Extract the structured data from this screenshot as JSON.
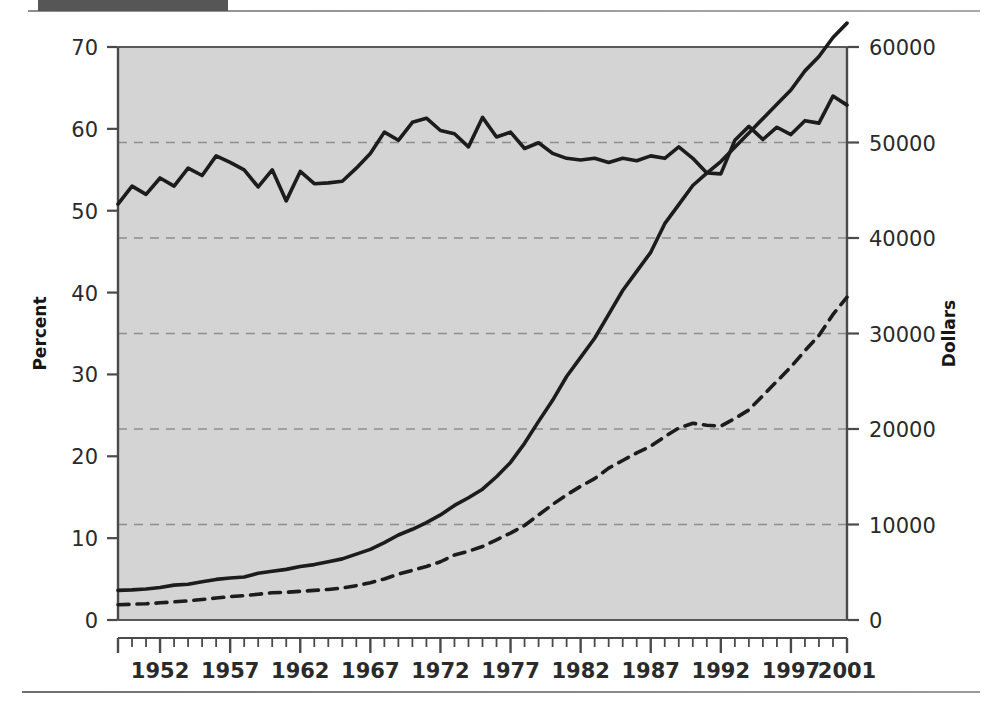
{
  "figure": {
    "title_block": "",
    "has_top_rule": true,
    "has_bottom_rule": true
  },
  "colors": {
    "plot_background": "#d4d4d4",
    "axis": "#4a4a4a",
    "series_solid": "#1c1c1c",
    "series_dashed": "#1c1c1c",
    "gridline": "#8d8d8d",
    "title_block": "#565656",
    "text": "#2a2a2a"
  },
  "chart_data": {
    "type": "line",
    "title": "",
    "xlabel": "",
    "ylabel": "Percent",
    "y2label": "Dollars",
    "xlim": [
      1949,
      2001
    ],
    "ylim": [
      0,
      70
    ],
    "y2lim": [
      0,
      60000
    ],
    "yticks": [
      0,
      10,
      20,
      30,
      40,
      50,
      60,
      70
    ],
    "yticklabels": [
      "0",
      "10",
      "20",
      "30",
      "40",
      "50",
      "60",
      "70"
    ],
    "y2ticks": [
      0,
      10000,
      20000,
      30000,
      40000,
      50000,
      60000
    ],
    "y2ticklabels": [
      "0",
      "10000",
      "20000",
      "30000",
      "40000",
      "50000",
      "60000"
    ],
    "xticks": [
      1952,
      1957,
      1962,
      1967,
      1972,
      1977,
      1982,
      1987,
      1992,
      1997,
      2001
    ],
    "xticklabels": [
      "1952",
      "1957",
      "1962",
      "1967",
      "1972",
      "1977",
      "1982",
      "1987",
      "1992",
      "1997",
      "2001"
    ],
    "minor_xticks_every": 1,
    "grid": true,
    "grid_axis": "y2",
    "grid_style": "dashed",
    "legend": null,
    "x": [
      1949,
      1950,
      1951,
      1952,
      1953,
      1954,
      1955,
      1956,
      1957,
      1958,
      1959,
      1960,
      1961,
      1962,
      1963,
      1964,
      1965,
      1966,
      1967,
      1968,
      1969,
      1970,
      1971,
      1972,
      1973,
      1974,
      1975,
      1976,
      1977,
      1978,
      1979,
      1980,
      1981,
      1982,
      1983,
      1984,
      1985,
      1986,
      1987,
      1988,
      1989,
      1990,
      1991,
      1992,
      1993,
      1994,
      1995,
      1996,
      1997,
      1998,
      1999,
      2000,
      2001
    ],
    "series": [
      {
        "name": "Percent",
        "axis": "left",
        "style": "solid",
        "units": "percent",
        "values": [
          50.8,
          53.0,
          52.0,
          54.0,
          53.0,
          55.2,
          54.3,
          56.7,
          55.9,
          55.0,
          52.9,
          55.0,
          51.2,
          54.8,
          53.3,
          53.4,
          53.6,
          55.2,
          57.0,
          59.6,
          58.6,
          60.8,
          61.3,
          59.8,
          59.4,
          57.8,
          61.4,
          59.0,
          59.6,
          57.6,
          58.3,
          57.0,
          56.4,
          56.2,
          56.4,
          55.9,
          56.4,
          56.1,
          56.7,
          56.4,
          57.8,
          56.4,
          54.6,
          54.5,
          58.6,
          60.3,
          58.7,
          60.2,
          59.3,
          61.0,
          60.7,
          64.0,
          62.9
        ]
      },
      {
        "name": "Dollars (solid rising)",
        "axis": "right",
        "style": "solid",
        "units": "dollars",
        "values": [
          3100,
          3150,
          3250,
          3400,
          3650,
          3750,
          4000,
          4250,
          4400,
          4500,
          4900,
          5100,
          5300,
          5600,
          5800,
          6100,
          6400,
          6900,
          7400,
          8100,
          8900,
          9500,
          10200,
          11000,
          12000,
          12800,
          13700,
          15000,
          16500,
          18500,
          20800,
          23000,
          25500,
          27500,
          29500,
          32000,
          34500,
          36500,
          38500,
          41500,
          43500,
          45500,
          46800,
          48000,
          49500,
          51000,
          52500,
          54000,
          55500,
          57500,
          59000,
          61000,
          62500
        ]
      },
      {
        "name": "Dollars (dashed)",
        "axis": "right",
        "style": "dashed",
        "units": "dollars",
        "values": [
          1600,
          1650,
          1700,
          1800,
          1900,
          2000,
          2150,
          2300,
          2450,
          2550,
          2700,
          2850,
          2900,
          3000,
          3100,
          3200,
          3350,
          3600,
          3900,
          4300,
          4800,
          5200,
          5600,
          6100,
          6800,
          7200,
          7700,
          8400,
          9100,
          9900,
          11000,
          12100,
          13100,
          14000,
          14800,
          15900,
          16700,
          17500,
          18200,
          19200,
          20100,
          20600,
          20400,
          20300,
          21100,
          22000,
          23500,
          25000,
          26500,
          28200,
          29800,
          32000,
          33800
        ]
      }
    ]
  }
}
